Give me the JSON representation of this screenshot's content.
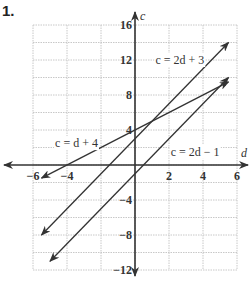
{
  "problem_number": "1.",
  "chart_data": {
    "type": "line",
    "title": "",
    "xlabel": "d",
    "ylabel": "c",
    "xlim": [
      -6,
      6
    ],
    "ylim": [
      -12,
      16
    ],
    "grid": true,
    "x_ticks": [
      -6,
      -4,
      2,
      4,
      6
    ],
    "y_ticks": [
      16,
      12,
      8,
      4,
      -4,
      -8,
      -12
    ],
    "x_tick_labels": [
      "−6",
      "−4",
      "2",
      "4",
      "6"
    ],
    "y_tick_labels": [
      "16",
      "12",
      "8",
      "4",
      "−4",
      "−8",
      "−12"
    ],
    "series": [
      {
        "name": "c = 2d + 3",
        "x": [
          -5.5,
          5.5
        ],
        "y": [
          -8,
          14
        ]
      },
      {
        "name": "c = d + 4",
        "x": [
          -5.5,
          5.5
        ],
        "y": [
          -1.5,
          9.5
        ]
      },
      {
        "name": "c = 2d − 1",
        "x": [
          -5,
          5.5
        ],
        "y": [
          -11,
          10
        ]
      }
    ],
    "annotations": [
      {
        "text": "c = 2d + 3",
        "x": 1.2,
        "y": 12
      },
      {
        "text": "c = d + 4",
        "x": -4.7,
        "y": 2.5
      },
      {
        "text": "c = 2d − 1",
        "x": 2.1,
        "y": 1.5
      }
    ]
  }
}
